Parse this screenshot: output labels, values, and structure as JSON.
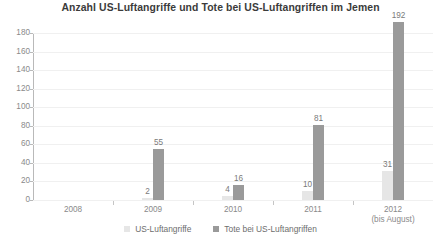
{
  "chart_data": {
    "type": "bar",
    "title": "Anzahl US-Luftangriffe und Tote bei US-Luftangriffen im Jemen",
    "xlabel": "",
    "ylabel": "",
    "ylim": [
      0,
      180
    ],
    "yticks": [
      0,
      20,
      40,
      60,
      80,
      100,
      120,
      140,
      160,
      180
    ],
    "categories": [
      "2008",
      "2009",
      "2010",
      "2011",
      "2012"
    ],
    "category_sublabels": [
      "",
      "",
      "",
      "",
      "(bis August)"
    ],
    "grid": true,
    "legend_position": "bottom",
    "series": [
      {
        "name": "US-Luftangriffe",
        "color": "#e6e6e6",
        "values": [
          0,
          2,
          4,
          10,
          31
        ],
        "labels": [
          "",
          "2",
          "4",
          "10",
          "31"
        ]
      },
      {
        "name": "Tote bei US-Luftangriffen",
        "color": "#9a9a9a",
        "values": [
          0,
          55,
          16,
          81,
          192
        ],
        "labels": [
          "",
          "55",
          "16",
          "81",
          "192"
        ]
      }
    ]
  },
  "source_note": ""
}
